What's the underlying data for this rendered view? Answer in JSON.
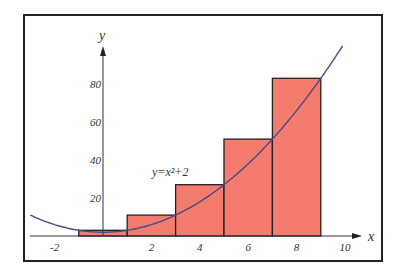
{
  "chart_data": {
    "type": "bar",
    "title": "",
    "xlabel": "x",
    "ylabel": "y",
    "function_label": "y=x²+2",
    "function": "x^2+2",
    "x_ticks": [
      "-2",
      "2",
      "4",
      "6",
      "8",
      "10"
    ],
    "x_tick_values": [
      -2,
      2,
      4,
      6,
      8,
      10
    ],
    "y_ticks": [
      "20",
      "40",
      "60",
      "80"
    ],
    "y_tick_values": [
      20,
      40,
      60,
      80
    ],
    "xlim": [
      -3,
      11
    ],
    "ylim": [
      0,
      100
    ],
    "bars": [
      {
        "x0": -1,
        "x1": 1,
        "height": 3
      },
      {
        "x0": 1,
        "x1": 3,
        "height": 11
      },
      {
        "x0": 3,
        "x1": 5,
        "height": 27
      },
      {
        "x0": 5,
        "x1": 7,
        "height": 51
      },
      {
        "x0": 7,
        "x1": 9,
        "height": 83
      }
    ],
    "categories": [
      "[-1,1]",
      "[1,3]",
      "[3,5]",
      "[5,7]",
      "[7,9]"
    ],
    "values": [
      3,
      11,
      27,
      51,
      83
    ],
    "grid": false,
    "legend": "none",
    "colors": {
      "bar_fill": "#f47c6e",
      "bar_edge": "#222222",
      "curve": "#4a4a8a",
      "axis": "#333333"
    }
  }
}
